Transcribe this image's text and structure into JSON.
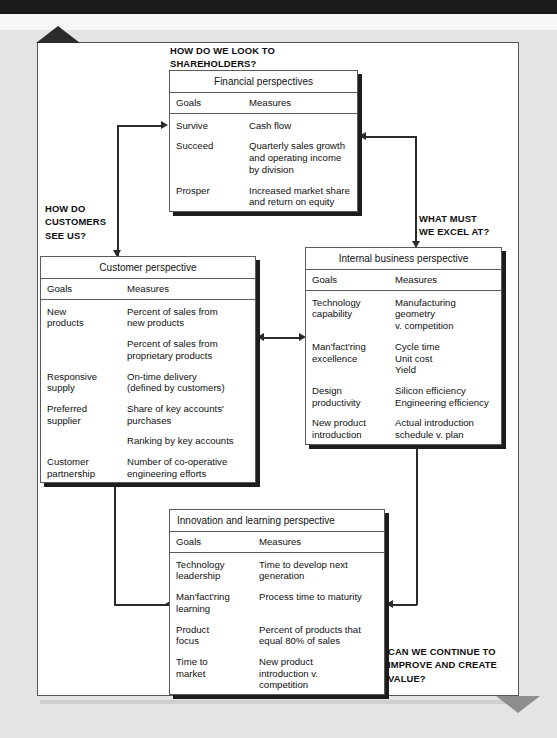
{
  "diagram": {
    "questions": {
      "shareholders": "HOW DO WE LOOK TO\nSHAREHOLDERS?",
      "customers": "HOW DO\nCUSTOMERS\nSEE US?",
      "excel": "WHAT MUST\nWE EXCEL AT?",
      "improve": "CAN WE CONTINUE TO\nIMPROVE AND CREATE\nVALUE?"
    },
    "column_headers": {
      "goals": "Goals",
      "measures": "Measures"
    },
    "boxes": {
      "financial": {
        "title": "Financial perspectives",
        "rows": [
          {
            "goal": "Survive",
            "measure": " Cash flow"
          },
          {
            "goal": "Succeed",
            "measure": "Quarterly sales growth\nand operating income\nby division"
          },
          {
            "goal": "Prosper",
            "measure": "Increased market share\nand return on equity"
          }
        ]
      },
      "customer": {
        "title": "Customer perspective",
        "rows": [
          {
            "goal": "New\nproducts",
            "measure": "Percent of sales from\nnew products"
          },
          {
            "goal": "",
            "measure": "Percent of sales from\nproprietary products"
          },
          {
            "goal": "Responsive\nsupply",
            "measure": "On-time delivery\n(defined by customers)"
          },
          {
            "goal": "Preferred\nsupplier",
            "measure": "Share of key accounts'\npurchases"
          },
          {
            "goal": "",
            "measure": "Ranking by key accounts"
          },
          {
            "goal": "Customer\npartnership",
            "measure": "Number of co-operative\nengineering efforts"
          }
        ]
      },
      "internal": {
        "title": "Internal business perspective",
        "rows": [
          {
            "goal": "Technology\ncapability",
            "measure": "Manufacturing geometry\nv. competition"
          },
          {
            "goal": "Man'fact'ring\nexcellence",
            "measure": "Cycle time\nUnit cost\nYield"
          },
          {
            "goal": "Design\nproductivity",
            "measure": "Silicon efficiency\nEngineering efficiency"
          },
          {
            "goal": "New product\nintroduction",
            "measure": "Actual introduction\nschedule v. plan"
          }
        ]
      },
      "innovation": {
        "title": "Innovation and learning perspective",
        "rows": [
          {
            "goal": "Technology\nleadership",
            "measure": "Time to develop next\ngeneration"
          },
          {
            "goal": "Man'fact'ring\nlearning",
            "measure": "Process time to maturity"
          },
          {
            "goal": "Product\nfocus",
            "measure": "Percent of products that\nequal 80% of sales"
          },
          {
            "goal": "Time to\nmarket",
            "measure": "New product\nintroduction  v.\ncompetition"
          }
        ]
      }
    },
    "colors": {
      "page_background": "#e4e4e4",
      "sheet": "#ffffff",
      "line": "#2a2a2a",
      "box_shadow": "#1d1d1d",
      "triangle_top": "#2b2b2b",
      "triangle_bottom": "#8e8e8e"
    }
  }
}
